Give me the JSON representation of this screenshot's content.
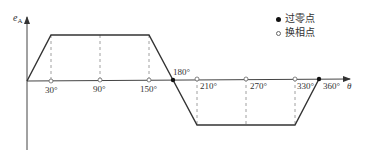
{
  "diagram": {
    "y_axis_label": "e",
    "y_axis_subscript": "A",
    "x_axis_label": "θ",
    "tick_labels": [
      "30°",
      "90°",
      "150°",
      "180°",
      "210°",
      "270°",
      "330°",
      "360°"
    ],
    "legend": [
      {
        "marker": "filled-dot",
        "label": "过零点"
      },
      {
        "marker": "hollow-dot",
        "label": "换相点"
      }
    ],
    "waveform": {
      "type": "trapezoid",
      "points_deg": [
        [
          0,
          0
        ],
        [
          30,
          1
        ],
        [
          150,
          1
        ],
        [
          180,
          0
        ],
        [
          210,
          -1
        ],
        [
          330,
          -1
        ],
        [
          360,
          0
        ]
      ],
      "zero_crossings_deg": [
        180,
        360
      ],
      "commutation_points_deg": [
        30,
        90,
        150,
        210,
        270,
        330
      ]
    },
    "colors": {
      "line": "#333333",
      "dashed": "#888888"
    }
  }
}
